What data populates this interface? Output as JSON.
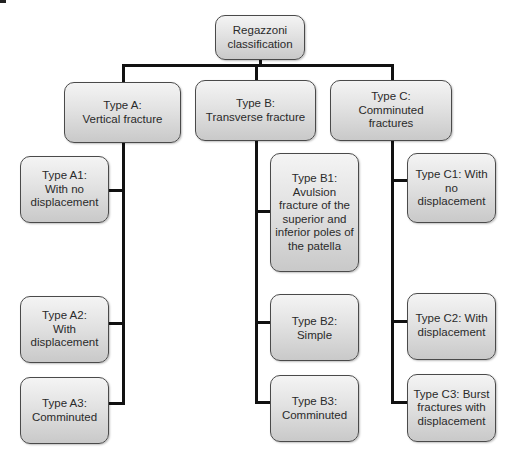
{
  "diagram": {
    "type": "hierarchy-tree",
    "root": {
      "id": "root",
      "label": "Regazzoni\nclassification"
    },
    "types": [
      {
        "id": "type-a",
        "label": "Type A:\nVertical fracture",
        "subtypes": [
          {
            "id": "type-a1",
            "label": "Type A1:\nWith no\ndisplacement"
          },
          {
            "id": "type-a2",
            "label": "Type A2:\nWith\ndisplacement"
          },
          {
            "id": "type-a3",
            "label": "Type A3:\nComminuted"
          }
        ]
      },
      {
        "id": "type-b",
        "label": "Type B:\nTransverse fracture",
        "subtypes": [
          {
            "id": "type-b1",
            "label": "Type B1:\nAvulsion\nfracture of the\nsuperior and\ninferior poles of\nthe patella"
          },
          {
            "id": "type-b2",
            "label": "Type B2: Simple"
          },
          {
            "id": "type-b3",
            "label": "Type B3:\nComminuted"
          }
        ]
      },
      {
        "id": "type-c",
        "label": "Type C:\nComminuted fractures",
        "subtypes": [
          {
            "id": "type-c1",
            "label": "Type C1: With no\ndisplacement"
          },
          {
            "id": "type-c2",
            "label": "Type C2: With\ndisplacement"
          },
          {
            "id": "type-c3",
            "label": "Type C3: Burst\nfractures with\ndisplacement"
          }
        ]
      }
    ],
    "colors": {
      "box_border": "#4a4a4a",
      "box_fill_top": "#f4f4f4",
      "box_fill_bottom": "#c9c9c9",
      "connector": "#111111",
      "text": "#2a2a2a"
    }
  }
}
